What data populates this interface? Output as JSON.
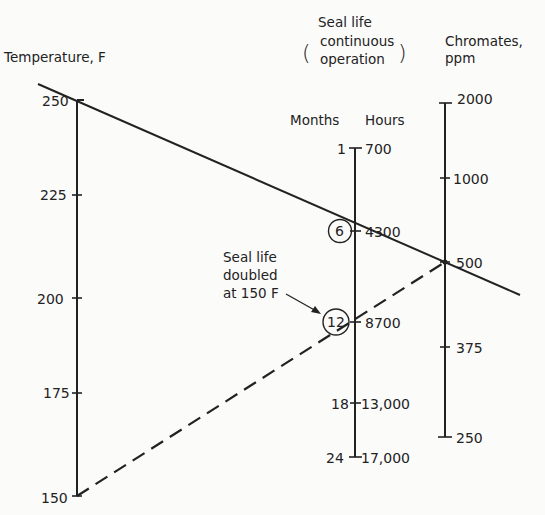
{
  "diagram": {
    "type": "nomograph",
    "background": "#fbfbfa",
    "ink": "#222222",
    "axes": [
      {
        "id": "temperature",
        "title": "Temperature, F",
        "ticks": [
          {
            "label": "250",
            "value": 250
          },
          {
            "label": "225",
            "value": 225
          },
          {
            "label": "200",
            "value": 200
          },
          {
            "label": "175",
            "value": 175
          },
          {
            "label": "150",
            "value": 150
          }
        ]
      },
      {
        "id": "seal-life",
        "title_line1": "Seal life",
        "title_line2": "continuous",
        "title_line3": "operation",
        "left_subtitle": "Months",
        "right_subtitle": "Hours",
        "ticks": [
          {
            "months": "1",
            "hours": "700"
          },
          {
            "months": "6",
            "hours": "4300",
            "circled": true
          },
          {
            "months": "12",
            "hours": "8700",
            "circled": true
          },
          {
            "months": "18",
            "hours": "13,000"
          },
          {
            "months": "24",
            "hours": "17,000"
          }
        ]
      },
      {
        "id": "chromates",
        "title_line1": "Chromates,",
        "title_line2": "ppm",
        "ticks": [
          {
            "label": "2000",
            "value": 2000
          },
          {
            "label": "1000",
            "value": 1000
          },
          {
            "label": "500",
            "value": 500
          },
          {
            "label": "375",
            "value": 375
          },
          {
            "label": "250",
            "value": 250
          }
        ]
      }
    ],
    "lines": [
      {
        "style": "solid",
        "from": "Temperature 250 F",
        "through": "Seal life 6 months (4300 h)",
        "to": "Chromates 500 ppm"
      },
      {
        "style": "dashed",
        "from": "Temperature 150 F",
        "through": "Seal life 12 months (8700 h)",
        "to": "Chromates 500 ppm"
      }
    ],
    "annotation": {
      "line1": "Seal life",
      "line2": "doubled",
      "line3": "at 150 F"
    }
  }
}
